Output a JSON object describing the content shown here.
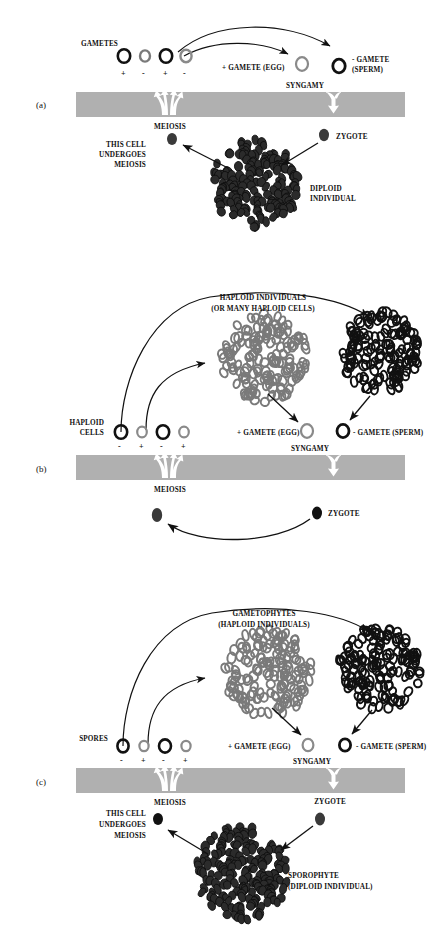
{
  "figure": {
    "type": "biology-life-cycle-diagram",
    "colors": {
      "band_gray": "#b0b0b0",
      "haploid_gray": "#7a7a7a",
      "diploid_dark": "#2b2b2b",
      "black": "#111111",
      "white": "#ffffff"
    }
  },
  "panels": [
    {
      "id": "a",
      "label": "(a)",
      "cells_label": "GAMETES",
      "signs": [
        "+",
        "-",
        "+",
        "-"
      ],
      "cell_fills": [
        "black",
        "gray",
        "black",
        "gray"
      ],
      "egg_label": "+ GAMETE (EGG)",
      "sperm_label": "- GAMETE\n(SPERM)",
      "sperm_line1": "- GAMETE",
      "sperm_line2": "(SPERM)",
      "syngamy_label": "SYNGAMY",
      "meiosis_label": "MEIOSIS",
      "zygote_label": "ZYGOTE",
      "this_cell_line1": "THIS CELL",
      "this_cell_line2": "UNDERGOES",
      "this_cell_line3": "MEIOSIS",
      "mass_label_line1": "DIPLOID",
      "mass_label_line2": "INDIVIDUAL"
    },
    {
      "id": "b",
      "label": "(b)",
      "cells_label_line1": "HAPLOID",
      "cells_label_line2": "CELLS",
      "signs": [
        "-",
        "+",
        "-",
        "+"
      ],
      "cell_fills": [
        "black",
        "gray",
        "black",
        "gray"
      ],
      "mass_label_line1": "HAPLOID INDIVIDUALS",
      "mass_label_line2": "(OR MANY HAPLOID CELLS)",
      "egg_label": "+ GAMETE (EGG)",
      "sperm_label": "- GAMETE (SPERM)",
      "syngamy_label": "SYNGAMY",
      "meiosis_label": "MEIOSIS",
      "zygote_label": "ZYGOTE"
    },
    {
      "id": "c",
      "label": "(c)",
      "cells_label": "SPORES",
      "signs": [
        "-",
        "+",
        "-",
        "+"
      ],
      "cell_fills": [
        "black",
        "gray",
        "black",
        "gray"
      ],
      "mass_label_line1": "GAMETOPHYTES",
      "mass_label_line2": "(HAPLOID INDIVIDUALS)",
      "egg_label": "+ GAMETE (EGG)",
      "sperm_label": "- GAMETE (SPERM)",
      "syngamy_label": "SYNGAMY",
      "meiosis_label": "MEIOSIS",
      "zygote_label": "ZYGOTE",
      "this_cell_line1": "THIS CELL",
      "this_cell_line2": "UNDERGOES",
      "this_cell_line3": "MEIOSIS",
      "sporophyte_line1": "SPOROPHYTE",
      "sporophyte_line2": "(DIPLOID INDIVIDUAL)"
    }
  ]
}
